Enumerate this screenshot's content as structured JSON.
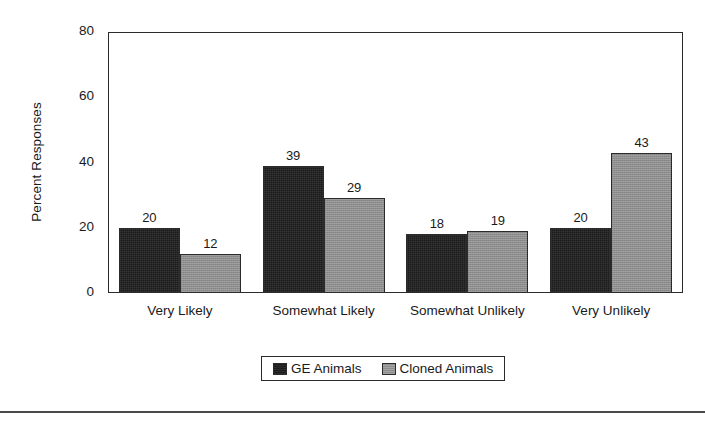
{
  "chart_data": {
    "type": "bar",
    "title": "",
    "subtitle": "",
    "xlabel": "",
    "ylabel": "Percent Responses",
    "categories": [
      "Very Likely",
      "Somewhat Likely",
      "Somewhat Unlikely",
      "Very Unlikely"
    ],
    "series": [
      {
        "name": "GE Animals",
        "values": [
          20,
          39,
          18,
          20
        ],
        "color": "#1c1c1c"
      },
      {
        "name": "Cloned Animals",
        "values": [
          12,
          29,
          19,
          43
        ],
        "color": "#8d8d8d"
      }
    ],
    "ylim": [
      0,
      80
    ],
    "yticks": [
      0,
      20,
      40,
      60,
      80
    ],
    "ytick_labels": [
      "0",
      "20",
      "40",
      "60",
      "80"
    ],
    "grid": false,
    "data_labels": true,
    "legend_position": "bottom-center",
    "bar_gap_within_group": 0,
    "axis_color": "#2b2b2b"
  }
}
